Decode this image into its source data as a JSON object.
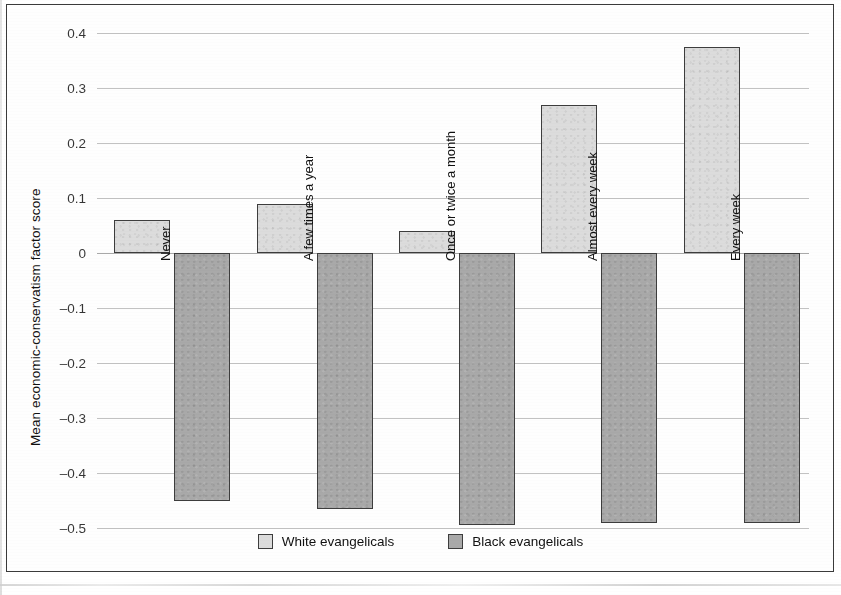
{
  "figure": {
    "background_color": "#ffffff",
    "frame_color": "#3a3a3a"
  },
  "chart_data": {
    "type": "bar",
    "title": "",
    "xlabel": "",
    "ylabel": "Mean economic-conservatism factor score",
    "ylim": [
      -0.5,
      0.4
    ],
    "ytick_labels": [
      "0.4",
      "0.3",
      "0.2",
      "0.1",
      "0",
      "–0.1",
      "–0.2",
      "–0.3",
      "–0.4",
      "–0.5"
    ],
    "ytick_values": [
      0.4,
      0.3,
      0.2,
      0.1,
      0,
      -0.1,
      -0.2,
      -0.3,
      -0.4,
      -0.5
    ],
    "grid": true,
    "legend_position": "bottom-center",
    "categories": [
      "Never",
      "A few times a year",
      "Once or twice a month",
      "Almost every week",
      "Every week"
    ],
    "series": [
      {
        "name": "White evangelicals",
        "color": "#dcdcdc",
        "edge_color": "#3d3d3d",
        "values": [
          0.06,
          0.09,
          0.04,
          0.27,
          0.375
        ]
      },
      {
        "name": "Black evangelicals",
        "color": "#a9a9a9",
        "edge_color": "#3d3d3d",
        "values": [
          -0.45,
          -0.465,
          -0.495,
          -0.49,
          -0.49
        ]
      }
    ]
  },
  "legend": {
    "items": [
      {
        "label": "White evangelicals",
        "swatch": "white-series"
      },
      {
        "label": "Black evangelicals",
        "swatch": "black-series"
      }
    ]
  }
}
